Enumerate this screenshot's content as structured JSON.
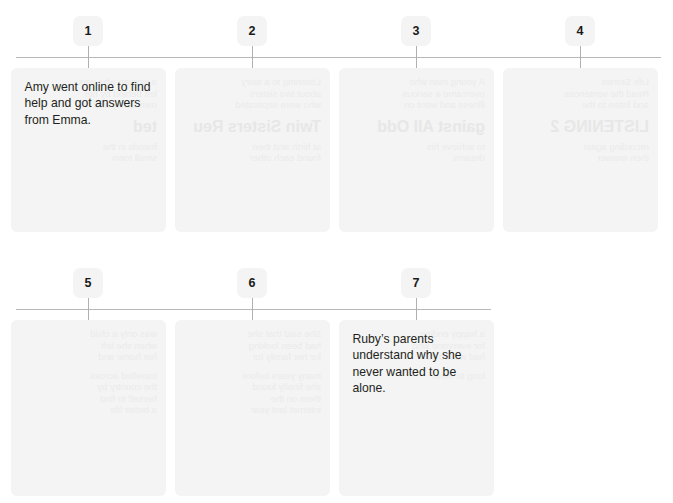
{
  "exercise": {
    "type": "numbered-timeline-sequencing",
    "total_steps": 7,
    "rows": [
      {
        "row_index": 1,
        "axis_left": 16,
        "axis_width": 645,
        "steps": [
          {
            "number": "1",
            "center_x": 88,
            "text": "Amy went online to find help and got answers from Emma.",
            "has_visible_text": true,
            "ghost": {
              "head": "ted",
              "lines": [
                "a woman who was",
                "left behind by her",
                "own family and",
                "friends in the",
                "small town"
              ]
            }
          },
          {
            "number": "2",
            "center_x": 252,
            "text": "",
            "has_visible_text": false,
            "ghost": {
              "head": "Twin Sisters Reu",
              "lines": [
                "Listening to a story",
                "about two sisters",
                "who were separated",
                "at birth and then",
                "found each other"
              ]
            }
          },
          {
            "number": "3",
            "center_x": 416,
            "text": "",
            "has_visible_text": false,
            "ghost": {
              "head": "gainst All Odd",
              "lines": [
                "A young man who",
                "overcame a serious",
                "illness and went on",
                "to achieve his",
                "dreams"
              ]
            }
          },
          {
            "number": "4",
            "center_x": 580,
            "text": "",
            "has_visible_text": false,
            "ghost": {
              "head": "LISTENING 2",
              "lines": [
                "Life Stories",
                "Read the sentences",
                "and listen to the",
                "recording again",
                "then answer"
              ]
            }
          }
        ]
      },
      {
        "row_index": 2,
        "axis_left": 16,
        "axis_width": 475,
        "steps": [
          {
            "number": "5",
            "center_x": 88,
            "text": "",
            "has_visible_text": false,
            "ghost": {
              "head": "",
              "lines": [
                "was only a child",
                "when she left",
                "her home and",
                "travelled across",
                "the country by",
                "herself to find",
                "a better life"
              ]
            }
          },
          {
            "number": "6",
            "center_x": 252,
            "text": "",
            "has_visible_text": false,
            "ghost": {
              "head": "",
              "lines": [
                "She said that she",
                "had been looking",
                "for her family for",
                "many years before",
                "she finally found",
                "them on the",
                "internet last year"
              ]
            }
          },
          {
            "number": "7",
            "center_x": 416,
            "text": "Ruby’s parents understand why she never wanted to be alone.",
            "has_visible_text": true,
            "ghost": {
              "head": "",
              "lines": [
                "a happy ending",
                "for everyone who",
                "had waited so",
                "long to meet"
              ]
            }
          }
        ]
      }
    ]
  },
  "colors": {
    "page_background": "#ffffff",
    "card_background": "#f4f4f4",
    "badge_background": "#f4f4f4",
    "rule": "#b7b7b7",
    "tick": "#b0b0b0",
    "text": "#231f20",
    "ghost_text": "#ebebeb"
  }
}
